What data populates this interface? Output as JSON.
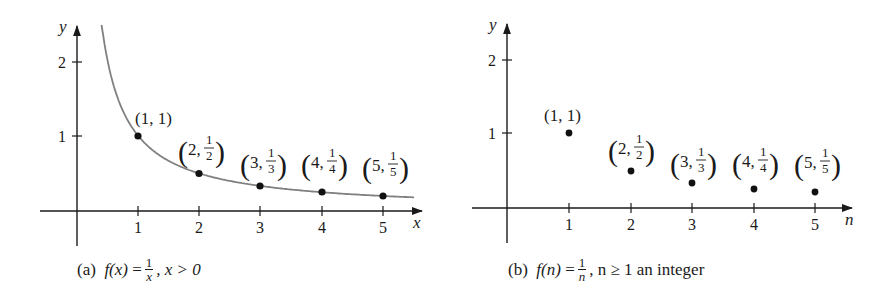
{
  "chart_data": [
    {
      "type": "line",
      "panel": "(a)",
      "title": "",
      "xlabel": "x",
      "ylabel": "y",
      "x_ticks": [
        "1",
        "2",
        "3",
        "4",
        "5"
      ],
      "y_ticks": [
        "1",
        "2"
      ],
      "xlim": [
        0,
        5.6
      ],
      "ylim": [
        0,
        2.5
      ],
      "grid": false,
      "series": [
        {
          "name": "f(x) = 1/x",
          "function": "1/x",
          "domain": [
            0.4,
            5.5
          ],
          "color": "#808080"
        }
      ],
      "points": [
        {
          "x": 1,
          "y": 1,
          "label": "(1, 1)"
        },
        {
          "x": 2,
          "y": 0.5,
          "label": "(2, 1/2)"
        },
        {
          "x": 3,
          "y": 0.3333,
          "label": "(3, 1/3)"
        },
        {
          "x": 4,
          "y": 0.25,
          "label": "(4, 1/4)"
        },
        {
          "x": 5,
          "y": 0.2,
          "label": "(5, 1/5)"
        }
      ],
      "caption": {
        "tag": "(a)",
        "lhs": "f(x)",
        "eq": "=",
        "num": "1",
        "den": "x",
        "rest": ", x > 0"
      }
    },
    {
      "type": "scatter",
      "panel": "(b)",
      "title": "",
      "xlabel": "n",
      "ylabel": "y",
      "x_ticks": [
        "1",
        "2",
        "3",
        "4",
        "5"
      ],
      "y_ticks": [
        "1",
        "2"
      ],
      "xlim": [
        0,
        5.6
      ],
      "ylim": [
        0,
        2.5
      ],
      "grid": false,
      "points": [
        {
          "x": 1,
          "y": 1,
          "label": "(1, 1)"
        },
        {
          "x": 2,
          "y": 0.5,
          "label": "(2, 1/2)"
        },
        {
          "x": 3,
          "y": 0.3333,
          "label": "(3, 1/3)"
        },
        {
          "x": 4,
          "y": 0.25,
          "label": "(4, 1/4)"
        },
        {
          "x": 5,
          "y": 0.2,
          "label": "(5, 1/5)"
        }
      ],
      "caption": {
        "tag": "(b)",
        "lhs": "f(n)",
        "eq": "=",
        "num": "1",
        "den": "n",
        "rest": ", n ≥ 1 an integer"
      }
    }
  ],
  "labels": {
    "a": {
      "xlabel": "x",
      "ylabel": "y",
      "xticks": [
        "1",
        "2",
        "3",
        "4",
        "5"
      ],
      "yticks": [
        "1",
        "2"
      ],
      "p1": "(1, 1)",
      "p2": {
        "a": "2,",
        "num": "1",
        "den": "2"
      },
      "p3": {
        "a": "3,",
        "num": "1",
        "den": "3"
      },
      "p4": {
        "a": "4,",
        "num": "1",
        "den": "4"
      },
      "p5": {
        "a": "5,",
        "num": "1",
        "den": "5"
      },
      "caption": {
        "tag": "(a)",
        "lhs": "f(x)",
        "eq": "=",
        "num": "1",
        "den": "x",
        "rest": ", x > 0"
      }
    },
    "b": {
      "xlabel": "n",
      "ylabel": "y",
      "xticks": [
        "1",
        "2",
        "3",
        "4",
        "5"
      ],
      "yticks": [
        "1",
        "2"
      ],
      "p1": "(1, 1)",
      "p2": {
        "a": "2,",
        "num": "1",
        "den": "2"
      },
      "p3": {
        "a": "3,",
        "num": "1",
        "den": "3"
      },
      "p4": {
        "a": "4,",
        "num": "1",
        "den": "4"
      },
      "p5": {
        "a": "5,",
        "num": "1",
        "den": "5"
      },
      "caption": {
        "tag": "(b)",
        "lhs": "f(n)",
        "eq": "=",
        "num": "1",
        "den": "n",
        "rest": ", n ≥ 1 an integer"
      }
    },
    "parens": {
      "open": "(",
      "close": ")"
    }
  },
  "colors": {
    "curve": "#808080",
    "ink": "#1a1a1a",
    "background": "#ffffff"
  }
}
